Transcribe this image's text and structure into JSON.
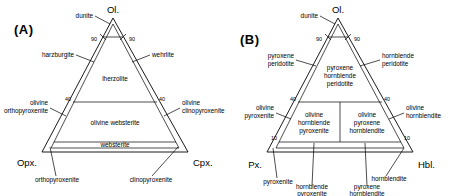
{
  "figure": {
    "type": "ternary-classification-diagram",
    "panels": [
      "A",
      "B"
    ]
  },
  "panel_a": {
    "label": "(A)",
    "vertices": {
      "top": "Ol.",
      "left": "Opx.",
      "right": "Cpx."
    },
    "ticks": {
      "top_left": "90",
      "top_right": "90",
      "mid_left": "40",
      "mid_right": "40"
    },
    "fields": [
      {
        "name": "lherzolite",
        "label": "lherzolite"
      },
      {
        "name": "olivine-websterite",
        "label": "olivine websterite"
      },
      {
        "name": "websterite",
        "label": "websterite"
      }
    ],
    "callouts": [
      {
        "name": "dunite",
        "label": "dunite"
      },
      {
        "name": "harzburgite",
        "label": "harzburgite"
      },
      {
        "name": "wehrlite",
        "label": "wehrlite"
      },
      {
        "name": "olivine-orthopyroxenite",
        "line1": "olivine",
        "line2": "orthopyroxenite"
      },
      {
        "name": "olivine-clinopyroxenite",
        "line1": "olivine",
        "line2": "clinopyroxenite"
      },
      {
        "name": "orthopyroxenite",
        "label": "orthopyroxenite"
      },
      {
        "name": "clinopyroxenite",
        "label": "clinopyroxenite"
      }
    ]
  },
  "panel_b": {
    "label": "(B)",
    "vertices": {
      "top": "Ol.",
      "left": "Px.",
      "right": "Hbl."
    },
    "ticks": {
      "top_left": "90",
      "top_right": "90",
      "mid_left": "40",
      "mid_right": "40",
      "low_left": "10",
      "low_right": "10"
    },
    "fields": [
      {
        "name": "pyroxene-hornblende-peridotite",
        "line1": "pyroxene",
        "line2": "hornblende",
        "line3": "peridotite"
      },
      {
        "name": "olivine-hornblende-pyroxenite",
        "line1": "olivine",
        "line2": "hornblende",
        "line3": "pyroxenite"
      },
      {
        "name": "olivine-pyroxene-hornblendite",
        "line1": "olivine",
        "line2": "pyroxene",
        "line3": "hornblendite"
      }
    ],
    "callouts": [
      {
        "name": "dunite",
        "label": "dunite"
      },
      {
        "name": "pyroxene-peridotite",
        "line1": "pyroxene",
        "line2": "peridotite"
      },
      {
        "name": "hornblende-peridotite",
        "line1": "hornblende",
        "line2": "peridotite"
      },
      {
        "name": "olivine-pyroxenite",
        "line1": "olivine",
        "line2": "pyroxenite"
      },
      {
        "name": "olivine-hornblendite",
        "line1": "olivine",
        "line2": "hornblendite"
      },
      {
        "name": "pyroxenite",
        "label": "pyroxenite"
      },
      {
        "name": "hornblendite",
        "label": "hornblendite"
      },
      {
        "name": "hornblende-pyroxenite",
        "line1": "hornblende",
        "line2": "pyroxenite"
      },
      {
        "name": "pyroxene-hornblendite",
        "line1": "pyroxene",
        "line2": "hornblendite"
      }
    ]
  },
  "colors": {
    "ink": "#000000",
    "background": "#ffffff"
  }
}
